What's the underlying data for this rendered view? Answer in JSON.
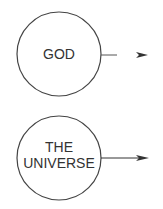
{
  "nodes": [
    {
      "id": "god",
      "label_lines": [
        "GOD"
      ]
    },
    {
      "id": "universe",
      "label_lines": [
        "THE",
        "UNIVERSE"
      ]
    }
  ],
  "edges": [
    {
      "from": "god",
      "style": "broken-arrow"
    },
    {
      "from": "universe",
      "style": "solid-arrow"
    }
  ],
  "colors": {
    "stroke": "#333333",
    "background": "#ffffff"
  }
}
